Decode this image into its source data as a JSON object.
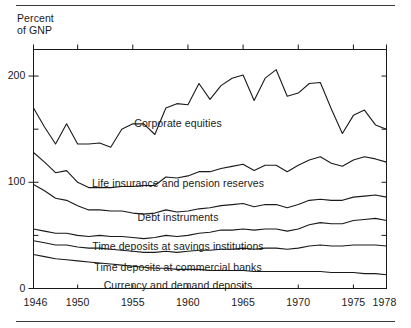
{
  "figure": {
    "axis_title_line1": "Percent",
    "axis_title_line2": "of GNP",
    "has_top_rule": true,
    "has_bottom_rule": true,
    "line_color": "#1a1a1a",
    "background": "#ffffff"
  },
  "chart_data": {
    "type": "area",
    "subtitle": "",
    "xlabel": "",
    "ylabel": "Percent of GNP",
    "xlim": [
      1946,
      1978
    ],
    "ylim": [
      0,
      225
    ],
    "grid": false,
    "legend_position": "inline-labels",
    "stacked": true,
    "y_ticks_major": [
      0,
      100,
      200
    ],
    "y_ticks_minor": [
      50,
      150
    ],
    "x_ticks": [
      1946,
      1950,
      1955,
      1960,
      1965,
      1970,
      1975,
      1978
    ],
    "x_tick_labels": [
      "1946",
      "1950",
      "1955",
      "1960",
      "1965",
      "1970",
      "1975",
      "1978"
    ],
    "y_tick_labels": [
      "0",
      "100",
      "200"
    ],
    "x": [
      1946,
      1947,
      1948,
      1949,
      1950,
      1951,
      1952,
      1953,
      1954,
      1955,
      1956,
      1957,
      1958,
      1959,
      1960,
      1961,
      1962,
      1963,
      1964,
      1965,
      1966,
      1967,
      1968,
      1969,
      1970,
      1971,
      1972,
      1973,
      1974,
      1975,
      1976,
      1977,
      1978
    ],
    "series": [
      {
        "name": "Currency and demand deposits",
        "label": "Currency and demand deposits",
        "order": 1,
        "values": [
          32,
          30,
          28,
          27,
          26,
          25,
          24,
          23,
          22,
          21,
          20,
          19,
          19,
          18,
          18,
          18,
          17,
          17,
          17,
          17,
          16,
          16,
          16,
          16,
          16,
          16,
          16,
          15,
          15,
          15,
          14,
          14,
          13
        ],
        "cumulative": [
          32,
          30,
          28,
          27,
          26,
          25,
          24,
          23,
          22,
          21,
          20,
          19,
          19,
          18,
          18,
          18,
          17,
          17,
          17,
          17,
          16,
          16,
          16,
          16,
          16,
          16,
          16,
          15,
          15,
          15,
          14,
          14,
          13
        ]
      },
      {
        "name": "Time deposits at commercial banks",
        "label": "Time deposits at commercial banks",
        "order": 2,
        "values": [
          13,
          13,
          13,
          14,
          13,
          13,
          14,
          14,
          14,
          14,
          14,
          15,
          16,
          16,
          17,
          18,
          19,
          20,
          20,
          21,
          21,
          22,
          22,
          21,
          22,
          24,
          25,
          25,
          25,
          26,
          27,
          27,
          27
        ],
        "cumulative": [
          45,
          43,
          41,
          41,
          39,
          38,
          38,
          37,
          36,
          35,
          34,
          34,
          35,
          34,
          35,
          36,
          36,
          37,
          37,
          38,
          37,
          38,
          38,
          37,
          38,
          40,
          41,
          40,
          40,
          41,
          41,
          41,
          40
        ]
      },
      {
        "name": "Time deposits at savings institutions",
        "label": "Time deposits at savings institutions",
        "order": 3,
        "values": [
          11,
          11,
          11,
          11,
          11,
          11,
          12,
          12,
          13,
          13,
          13,
          14,
          15,
          15,
          15,
          16,
          17,
          18,
          18,
          18,
          18,
          18,
          18,
          17,
          18,
          20,
          21,
          21,
          21,
          23,
          24,
          25,
          24
        ],
        "cumulative": [
          56,
          54,
          52,
          52,
          50,
          49,
          50,
          49,
          49,
          48,
          47,
          48,
          50,
          49,
          50,
          52,
          53,
          55,
          55,
          56,
          55,
          56,
          56,
          54,
          56,
          60,
          62,
          61,
          61,
          64,
          65,
          66,
          64
        ]
      },
      {
        "name": "Debt instruments",
        "label": "Debt instruments",
        "order": 4,
        "values": [
          42,
          38,
          33,
          31,
          28,
          25,
          24,
          24,
          24,
          23,
          23,
          23,
          24,
          23,
          23,
          23,
          23,
          23,
          24,
          24,
          22,
          23,
          23,
          22,
          23,
          23,
          22,
          22,
          22,
          22,
          22,
          22,
          22
        ],
        "cumulative": [
          98,
          92,
          85,
          83,
          78,
          74,
          74,
          73,
          73,
          71,
          70,
          71,
          74,
          72,
          73,
          75,
          76,
          78,
          79,
          80,
          77,
          79,
          79,
          76,
          79,
          83,
          84,
          83,
          83,
          86,
          87,
          88,
          86
        ]
      },
      {
        "name": "Life insurance and pension reserves",
        "label": "Life insurance and pension reserves",
        "order": 5,
        "values": [
          30,
          27,
          24,
          28,
          22,
          21,
          21,
          22,
          23,
          25,
          27,
          26,
          31,
          32,
          33,
          35,
          34,
          35,
          36,
          37,
          34,
          37,
          37,
          34,
          37,
          38,
          40,
          35,
          32,
          35,
          37,
          34,
          33
        ],
        "cumulative": [
          128,
          119,
          109,
          111,
          100,
          95,
          95,
          95,
          96,
          96,
          97,
          97,
          105,
          104,
          106,
          110,
          110,
          113,
          115,
          117,
          111,
          116,
          116,
          110,
          116,
          121,
          124,
          118,
          115,
          121,
          124,
          122,
          119
        ]
      },
      {
        "name": "Corporate equities",
        "label": "Corporate equities",
        "order": 6,
        "values": [
          42,
          33,
          27,
          44,
          36,
          41,
          42,
          38,
          54,
          59,
          58,
          48,
          65,
          70,
          67,
          83,
          68,
          78,
          83,
          84,
          66,
          82,
          90,
          71,
          68,
          72,
          70,
          51,
          31,
          42,
          44,
          32,
          31
        ],
        "cumulative": [
          170,
          152,
          136,
          155,
          136,
          136,
          137,
          133,
          150,
          155,
          155,
          145,
          170,
          174,
          173,
          193,
          178,
          191,
          198,
          201,
          177,
          198,
          206,
          181,
          184,
          193,
          194,
          169,
          146,
          163,
          168,
          154,
          150
        ]
      }
    ],
    "series_labels_in_plot": [
      "Corporate equities",
      "Life insurance and pension reserves",
      "Debt instruments",
      "Time deposits at savings institutions",
      "Time deposits at commercial banks",
      "Currency and demand deposits"
    ]
  }
}
